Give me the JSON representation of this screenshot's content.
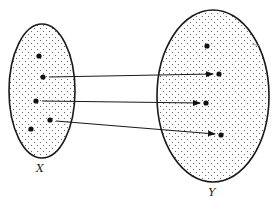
{
  "diagram": {
    "type": "function-mapping",
    "colors": {
      "stroke": "#1a1a1a",
      "dot": "#111111",
      "stipple": "#555555",
      "background": "#ffffff"
    },
    "sets": [
      {
        "id": "X",
        "label": "X",
        "ellipse": {
          "cx": 42,
          "cy": 91,
          "rx": 33,
          "ry": 67
        },
        "label_pos": {
          "x": 40,
          "y": 172
        },
        "points": [
          {
            "x": 39,
            "y": 56
          },
          {
            "x": 43,
            "y": 77
          },
          {
            "x": 36,
            "y": 101
          },
          {
            "x": 50,
            "y": 120
          },
          {
            "x": 31,
            "y": 129
          }
        ]
      },
      {
        "id": "Y",
        "label": "Y",
        "ellipse": {
          "cx": 213,
          "cy": 96,
          "rx": 56,
          "ry": 86
        },
        "label_pos": {
          "x": 212,
          "y": 196
        },
        "points": [
          {
            "x": 207,
            "y": 46
          },
          {
            "x": 219,
            "y": 74
          },
          {
            "x": 206,
            "y": 103
          },
          {
            "x": 221,
            "y": 135
          }
        ]
      }
    ],
    "arrows": [
      {
        "from": {
          "x": 49,
          "y": 77
        },
        "to": {
          "x": 213,
          "y": 74
        }
      },
      {
        "from": {
          "x": 42,
          "y": 101
        },
        "to": {
          "x": 200,
          "y": 103
        }
      },
      {
        "from": {
          "x": 56,
          "y": 121
        },
        "to": {
          "x": 215,
          "y": 134
        }
      }
    ],
    "stray_mark": {
      "x1": 252,
      "y1": 44,
      "x2": 260,
      "y2": 46
    }
  }
}
